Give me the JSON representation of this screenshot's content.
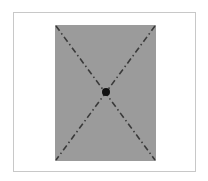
{
  "diagram": {
    "colors": {
      "frame_border": "#c8c8c8",
      "rectangle_fill": "#9b9b9b",
      "diagonal_stroke": "#3a3a3a",
      "center_point": "#111111"
    },
    "elements": [
      {
        "name": "rectangle",
        "role": "frame region"
      },
      {
        "name": "diagonal-1",
        "from": "top-left",
        "to": "bottom-right",
        "style": "dash-dot"
      },
      {
        "name": "diagonal-2",
        "from": "top-right",
        "to": "bottom-left",
        "style": "dash-dot"
      },
      {
        "name": "center-point",
        "at": "intersection of diagonals"
      }
    ]
  }
}
